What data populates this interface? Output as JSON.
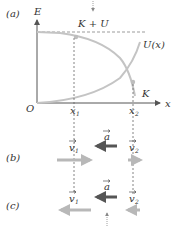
{
  "panels": {
    "a": {
      "label": "(a)"
    },
    "b": {
      "label": "(b)"
    },
    "c": {
      "label": "(c)"
    }
  },
  "graph": {
    "y_axis_label": "E",
    "x_axis_label": "x",
    "origin_label": "O",
    "total_energy_label": "K + U",
    "potential_label": "U(x)",
    "kinetic_label": "K",
    "x1_label": "x",
    "x1_sub": "1",
    "x2_label": "x",
    "x2_sub": "2"
  },
  "vectors": {
    "b": {
      "v1": "v",
      "v1_sub": "1",
      "a": "a",
      "v2": "v",
      "v2_sub": "2"
    },
    "c": {
      "v1": "v",
      "v1_sub": "1",
      "a": "a",
      "v2": "v",
      "v2_sub": "2"
    }
  },
  "colors": {
    "axis": "#555555",
    "curve": "#c4c4c4",
    "velocity_arrow": "#b8b8b8",
    "accel_arrow": "#555555",
    "dashed": "#666666",
    "total_dashed": "#bdbdbd"
  }
}
